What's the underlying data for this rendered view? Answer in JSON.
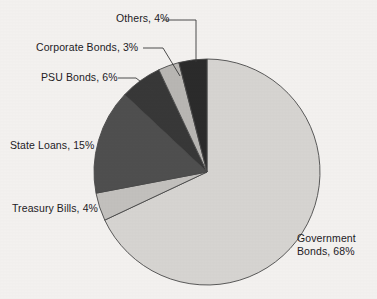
{
  "chart_data": {
    "type": "pie",
    "title": "",
    "labels": [
      "Government Bonds",
      "Treasury Bills",
      "State Loans",
      "PSU Bonds",
      "Corporate Bonds",
      "Others"
    ],
    "values": [
      68,
      4,
      15,
      6,
      3,
      4
    ],
    "unit": "%",
    "start_angle_deg": 0,
    "direction": "clockwise",
    "legend": "none",
    "grid": false,
    "slices": [
      {
        "name": "Government Bonds",
        "value": 68,
        "label_text": "Government Bonds, 68%",
        "label_line1": "Government",
        "label_line2": "Bonds, 68%",
        "color": "#d6d4d1"
      },
      {
        "name": "Treasury Bills",
        "value": 4,
        "label_text": "Treasury Bills, 4%",
        "color": "#c2c0bd"
      },
      {
        "name": "State Loans",
        "value": 15,
        "label_text": "State Loans, 15%",
        "color": "#4f4f4f"
      },
      {
        "name": "PSU Bonds",
        "value": 6,
        "label_text": "PSU Bonds, 6%",
        "color": "#383838"
      },
      {
        "name": "Corporate Bonds",
        "value": 3,
        "label_text": "Corporate Bonds, 3%",
        "color": "#b8b6b3"
      },
      {
        "name": "Others",
        "value": 4,
        "label_text": "Others, 4%",
        "color": "#2b2b2b"
      }
    ],
    "colors": {
      "background": "#f3f1ef",
      "outline": "#4a4a4a",
      "label_text": "#23211f",
      "leader_line": "#3a3a3a"
    },
    "geometry": {
      "center_x": 207,
      "center_y": 172,
      "radius": 113
    }
  }
}
